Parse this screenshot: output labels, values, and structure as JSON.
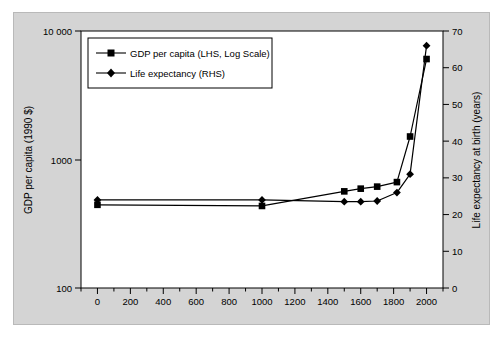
{
  "figure": {
    "background": "#d4d4d4",
    "plot_background": "#ffffff",
    "frame_color": "#000000"
  },
  "axes": {
    "left": {
      "title": "GDP per capita (1990 $)",
      "ticks": [
        "10 000",
        "1000",
        "100"
      ],
      "scale": "log",
      "min": 100,
      "max": 10000
    },
    "right": {
      "title": "Life expectancy at birth (years)",
      "ticks": [
        "70",
        "60",
        "50",
        "40",
        "30",
        "20",
        "10",
        "0"
      ],
      "scale": "linear",
      "min": 0,
      "max": 70
    },
    "bottom": {
      "title": "",
      "ticks": [
        "0",
        "200",
        "400",
        "600",
        "800",
        "1000",
        "1200",
        "1400",
        "1600",
        "1800",
        "2000"
      ],
      "min": -100,
      "max": 2100,
      "minor_step": 100
    }
  },
  "legend": {
    "position": "top-left-inside",
    "entries": [
      {
        "label": "GDP per capita (LHS, Log Scale)",
        "marker": "square",
        "color": "#000000"
      },
      {
        "label": "Life expectancy (RHS)",
        "marker": "diamond",
        "color": "#000000"
      }
    ]
  },
  "chart_data": {
    "type": "line",
    "title": "",
    "xlabel": "",
    "ylabel": "GDP per capita (1990 $)",
    "y2label": "Life expectancy at birth (years)",
    "xlim": [
      -100,
      2100
    ],
    "ylim": [
      100,
      10000
    ],
    "y2lim": [
      0,
      70
    ],
    "ylog": true,
    "grid": false,
    "legend_position": "upper left",
    "series": [
      {
        "name": "GDP per capita (LHS, Log Scale)",
        "axis": "left",
        "marker": "square",
        "color": "#000000",
        "x": [
          0,
          1000,
          1500,
          1600,
          1700,
          1820,
          1900,
          2000
        ],
        "y": [
          444,
          435,
          565,
          593,
          615,
          667,
          1510,
          6050
        ]
      },
      {
        "name": "Life expectancy (RHS)",
        "axis": "right",
        "marker": "diamond",
        "color": "#000000",
        "x": [
          0,
          1000,
          1500,
          1600,
          1700,
          1820,
          1900,
          2000
        ],
        "y": [
          24,
          24,
          23.5,
          23.5,
          23.7,
          26,
          31,
          66
        ]
      }
    ]
  }
}
